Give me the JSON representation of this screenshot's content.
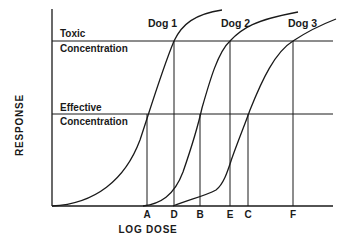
{
  "diagram": {
    "y_axis_label": "RESPONSE",
    "x_axis_label": "LOG DOSE",
    "thresholds": [
      {
        "line1": "Toxic",
        "line2": "Concentration"
      },
      {
        "line1": "Effective",
        "line2": "Concentration"
      }
    ],
    "curves": [
      {
        "label": "Dog 1"
      },
      {
        "label": "Dog 2"
      },
      {
        "label": "Dog 3"
      }
    ],
    "dose_markers": [
      "A",
      "D",
      "B",
      "E",
      "C",
      "F"
    ],
    "colors": {
      "ink": "#1a1a1a",
      "background": "#ffffff"
    }
  }
}
